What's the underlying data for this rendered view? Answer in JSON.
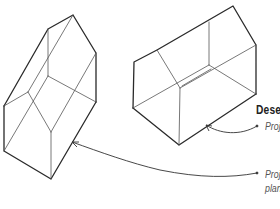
{
  "diagram": {
    "type": "annotated-illustration",
    "labels": {
      "heading": "Dese",
      "callout_1": "Proj",
      "callout_2_line1": "Proj",
      "callout_2_line2": "plan"
    },
    "colors": {
      "stroke": "#2a2a2a",
      "thin_stroke": "#555555",
      "text": "#222222",
      "caption_text": "#555555",
      "background": "#ffffff"
    }
  }
}
